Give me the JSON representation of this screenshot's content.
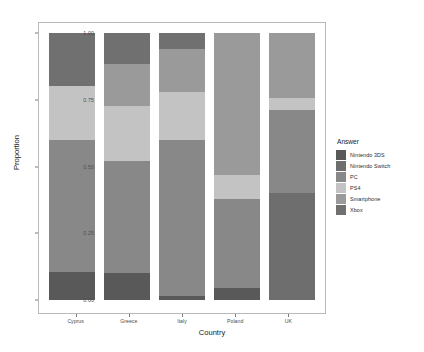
{
  "chart_data": {
    "type": "bar",
    "stacked": true,
    "normalized": true,
    "title": "",
    "xlabel": "Country",
    "ylabel": "Proportion",
    "ylim": [
      0,
      1
    ],
    "ytick_labels": [
      "0.00",
      "0.25",
      "0.50",
      "0.75",
      "1.00"
    ],
    "ytick_values": [
      0,
      0.25,
      0.5,
      0.75,
      1
    ],
    "grid": false,
    "legend_title": "Answer",
    "legend_position": "right",
    "categories": [
      "Cyprus",
      "Greece",
      "Italy",
      "Poland",
      "UK"
    ],
    "series": [
      {
        "name": "Nintendo 3DS",
        "color": "#595959",
        "values": [
          0.105,
          0.1,
          0.015,
          0.045,
          0.0
        ]
      },
      {
        "name": "Nintendo Switch",
        "color": "#6e6e6e",
        "values": [
          0.0,
          0.0,
          0.0,
          0.0,
          0.4
        ]
      },
      {
        "name": "PC",
        "color": "#888888",
        "values": [
          0.495,
          0.42,
          0.585,
          0.335,
          0.31
        ]
      },
      {
        "name": "PS4",
        "color": "#c3c3c3",
        "values": [
          0.2,
          0.205,
          0.18,
          0.09,
          0.045
        ]
      },
      {
        "name": "Smartphone",
        "color": "#9a9a9a",
        "values": [
          0.0,
          0.16,
          0.16,
          0.53,
          0.245
        ]
      },
      {
        "name": "Xbox",
        "color": "#707070",
        "values": [
          0.2,
          0.115,
          0.06,
          0.0,
          0.0
        ]
      }
    ],
    "stack_order_bottom_to_top": [
      "Nintendo 3DS",
      "Nintendo Switch",
      "PC",
      "PS4",
      "Smartphone",
      "Xbox"
    ]
  },
  "legend": {
    "title": "Answer",
    "items": [
      {
        "label": "Nintendo 3DS",
        "color": "#595959"
      },
      {
        "label": "Nintendo Switch",
        "color": "#6e6e6e"
      },
      {
        "label": "PC",
        "color": "#888888"
      },
      {
        "label": "PS4",
        "color": "#c3c3c3"
      },
      {
        "label": "Smartphone",
        "color": "#9a9a9a"
      },
      {
        "label": "Xbox",
        "color": "#707070"
      }
    ]
  },
  "axes": {
    "x_title": "Country",
    "y_title": "Proportion"
  }
}
